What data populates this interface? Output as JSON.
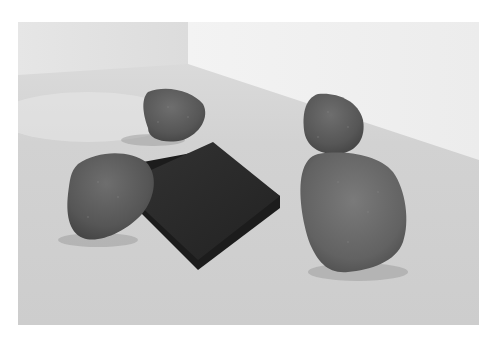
{
  "image": {
    "description": "Gallery installation photograph: five rough grey stones arranged around a dark square plate lying on a white gallery floor in a room corner",
    "alt": "Stones surrounding a dark square plate on a gallery floor"
  },
  "scene": {
    "wall_left_color": "#e4e4e4",
    "wall_right_color": "#f1f1f1",
    "floor_color": "#cfcfcf",
    "plate_color": "#2a2a2a",
    "stone_color": "#5e5e5e"
  },
  "objects": [
    {
      "name": "plate",
      "label": "Dark square plate"
    },
    {
      "name": "stone-back-left",
      "label": "Stone"
    },
    {
      "name": "stone-back-right",
      "label": "Stone"
    },
    {
      "name": "stone-front-left",
      "label": "Stone"
    },
    {
      "name": "stone-front-right",
      "label": "Stone"
    }
  ]
}
